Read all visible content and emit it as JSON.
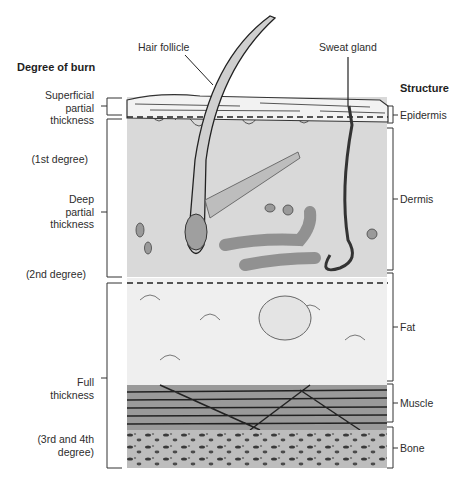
{
  "diagram": {
    "left_header": "Degree of burn",
    "right_header": "Structure",
    "callouts": {
      "hair_follicle": "Hair follicle",
      "sweat_gland": "Sweat gland"
    },
    "burn_degrees": [
      {
        "lines": [
          "Superficial",
          "partial",
          "thickness"
        ]
      },
      {
        "lines": [
          "Deep",
          "partial",
          "thickness"
        ],
        "note": "(1st degree)",
        "note2": "(2nd degree)"
      },
      {
        "lines": [
          "Full",
          "thickness"
        ],
        "note": "(3rd and 4th",
        "note_b": "degree)"
      }
    ],
    "structures": [
      "Epidermis",
      "Dermis",
      "Fat",
      "Muscle",
      "Bone"
    ],
    "colors": {
      "epidermis": "#f2f2f2",
      "dermis": "#d9d9d9",
      "fat": "#efefef",
      "muscle": "#9a9a9a",
      "bone": "#bdbdbd",
      "line": "#333333"
    }
  }
}
